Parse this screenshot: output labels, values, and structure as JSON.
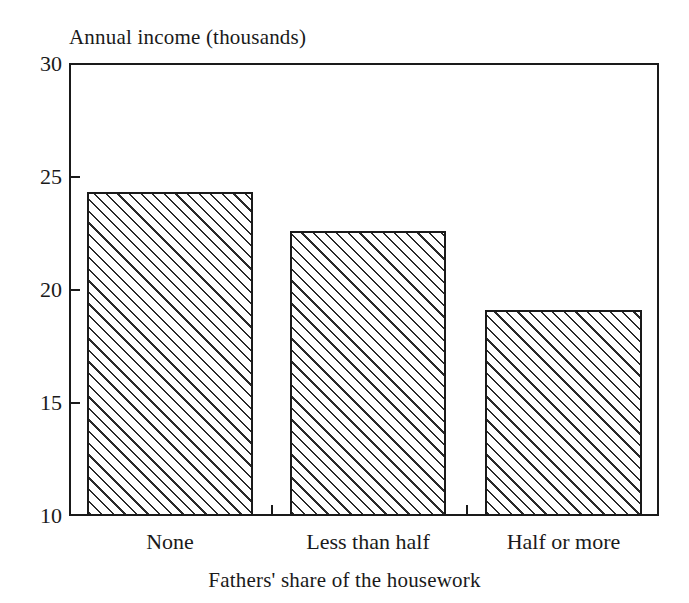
{
  "chart_data": {
    "type": "bar",
    "title": "",
    "xlabel": "Fathers' share of the housework",
    "ylabel": "Annual income (thousands)",
    "categories": [
      "None",
      "Less than half",
      "Half or more"
    ],
    "values": [
      24.3,
      22.6,
      19.1
    ],
    "ylim": [
      10,
      30
    ],
    "yticks": [
      "10",
      "15",
      "20",
      "25",
      "30"
    ],
    "ytick_values": [
      10,
      15,
      20,
      25,
      30
    ],
    "grid": false,
    "legend": "none",
    "series": [
      {
        "name": "Annual income (thousands)",
        "values": [
          24.3,
          22.6,
          19.1
        ]
      }
    ],
    "bar_fill": "diagonal-hatch",
    "bar_edge_color": "#1a1a1a",
    "background_color": "#ffffff"
  },
  "axis": {
    "y_title": "Annual income (thousands)",
    "x_title": "Fathers' share of the housework",
    "y_labels": {
      "t30": "30",
      "t25": "25",
      "t20": "20",
      "t15": "15",
      "t10": "10"
    },
    "x_labels": {
      "c0": "None",
      "c1": "Less than half",
      "c2": "Half or more"
    }
  }
}
